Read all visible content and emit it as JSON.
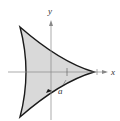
{
  "figure": {
    "type": "deltoid (three-cusped hypocycloid)",
    "axes": {
      "x_label": "x",
      "y_label": "y"
    },
    "annotations": [
      {
        "label": "a",
        "description": "length marker from origin toward right cusp"
      }
    ],
    "colors": {
      "fill": "#d9d9d9",
      "curve": "#1a1a1a",
      "axis": "#888888"
    }
  }
}
